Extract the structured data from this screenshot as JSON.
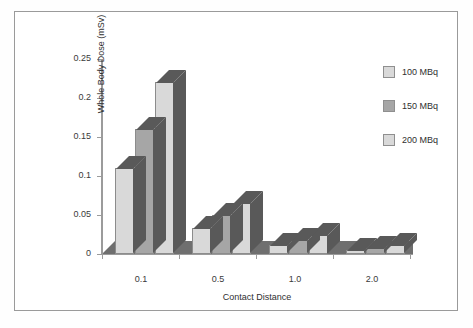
{
  "chart_data": {
    "type": "bar",
    "title": "",
    "xlabel": "Contact Distance",
    "ylabel": "Whole Body Dose (mSv)",
    "categories": [
      "0.1",
      "0.5",
      "1.0",
      "2.0"
    ],
    "series": [
      {
        "name": "100 MBq",
        "color": "#d9d9d9",
        "values": [
          0.11,
          0.033,
          0.012,
          0.005
        ]
      },
      {
        "name": "150 MBq",
        "color": "#a6a6a6",
        "values": [
          0.16,
          0.05,
          0.018,
          0.008
        ]
      },
      {
        "name": "200 MBq",
        "color": "#d9d9d9",
        "values": [
          0.22,
          0.065,
          0.025,
          0.012
        ]
      }
    ],
    "ylim": [
      0,
      0.25
    ],
    "yticks": [
      "0",
      "0.05",
      "0.1",
      "0.15",
      "0.2",
      "0.25"
    ],
    "ytick_values": [
      0,
      0.05,
      0.1,
      0.15,
      0.2,
      0.25
    ],
    "grid": false,
    "legend_position": "right",
    "style": "3d-column",
    "colors": {
      "bar_light": "#d9d9d9",
      "bar_mid": "#a6a6a6",
      "bar_shadow": "#595959",
      "axis": "#9b9b9b",
      "floor": "#6f6f6f",
      "frame": "#9a9a9a",
      "text": "#2f2f2f",
      "background": "#ffffff"
    }
  },
  "legend": {
    "items": [
      {
        "label": "100 MBq"
      },
      {
        "label": "150 MBq"
      },
      {
        "label": "200 MBq"
      }
    ]
  },
  "axes": {
    "y_title": "Whole Body Dose (mSv)",
    "x_title": "Contact Distance",
    "y_labels": [
      "0.25",
      "0.2",
      "0.15",
      "0.1",
      "0.05",
      "0"
    ],
    "x_labels": [
      "0.1",
      "0.5",
      "1.0",
      "2.0"
    ]
  }
}
